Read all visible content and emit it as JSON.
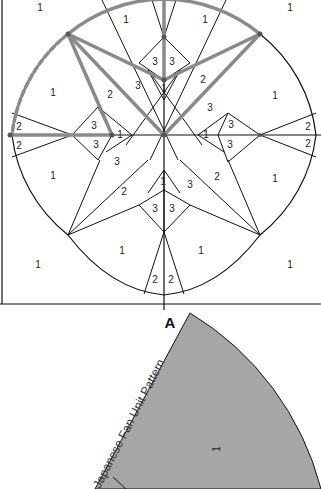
{
  "diagram": {
    "piece_numbers": {
      "top_left_corner": "1",
      "top_left_arc": "1",
      "top_right_arc": "1",
      "top_right_corner": "1",
      "center_top_left_3": "3",
      "center_top_right_3": "3",
      "left_mid_1": "1",
      "upper_left_3": "3",
      "upper_left_2": "2",
      "center_top_1": "1",
      "upper_right_2": "2",
      "upper_right_3": "3",
      "right_mid_1": "1",
      "left_edge_2a": "2",
      "left_edge_2b": "2",
      "left_inner_3a": "3",
      "left_inner_3b": "3",
      "left_inner_1": "1",
      "right_inner_1": "1",
      "right_inner_3a": "3",
      "right_inner_3b": "3",
      "right_edge_2a": "2",
      "right_edge_2b": "2",
      "lower_left_3": "3",
      "lower_left_1": "1",
      "lower_left_2": "2",
      "center_bottom_1": "1",
      "lower_right_3": "3",
      "lower_right_2": "2",
      "lower_right_1": "1",
      "center_bot_3a": "3",
      "center_bot_3b": "3",
      "bottom_left_corner": "1",
      "bottom_left_arc": "1",
      "bottom_right_arc": "1",
      "bottom_right_corner": "1",
      "bottom_2a": "2",
      "bottom_2b": "2"
    },
    "colors": {
      "line": "#111111",
      "highlight": "#8a8a8a",
      "pattern_fill": "#a6a6a6"
    }
  },
  "pattern_piece": {
    "label": "A",
    "title": "Japanese Fan Unit Pattern",
    "piece_number": "1"
  }
}
